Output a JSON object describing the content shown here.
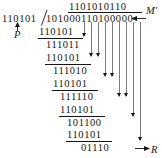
{
  "figure": {
    "type": "binary-long-division",
    "divisor": "110101",
    "dividend": "101000110100000",
    "quotient": "1101010110",
    "remainder": "01110",
    "labels": {
      "dividend_label": "M'",
      "divisor_label": "P",
      "remainder_label": "R"
    },
    "steps": [
      {
        "subtrahend": "110101",
        "partial": "111011"
      },
      {
        "subtrahend": "110101",
        "partial": "111010"
      },
      {
        "subtrahend": "110101",
        "partial": "111110"
      },
      {
        "subtrahend": "110101",
        "partial": "101100"
      },
      {
        "subtrahend": "110101",
        "partial": "110010"
      },
      {
        "subtrahend": "110101",
        "partial": "01110"
      }
    ]
  },
  "colors": {
    "ink": "#161616",
    "dropline": "#7a7a7a",
    "paper": "#ffffff"
  }
}
